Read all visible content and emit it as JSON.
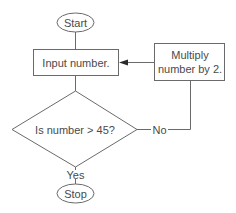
{
  "diagram": {
    "type": "flowchart",
    "nodes": {
      "start": {
        "label": "Start",
        "shape": "ellipse"
      },
      "input": {
        "label": "Input number.",
        "shape": "rectangle"
      },
      "multiply": {
        "line1": "Multiply",
        "line2": "number by 2.",
        "shape": "rectangle"
      },
      "decision": {
        "label": "Is number > 45?",
        "shape": "diamond"
      },
      "stop": {
        "label": "Stop",
        "shape": "ellipse"
      }
    },
    "edges": {
      "start_to_input": {
        "from": "start",
        "to": "input",
        "label": ""
      },
      "input_to_decision": {
        "from": "input",
        "to": "decision",
        "label": ""
      },
      "decision_no": {
        "from": "decision",
        "to": "multiply",
        "label": "No"
      },
      "multiply_to_input": {
        "from": "multiply",
        "to": "input",
        "label": ""
      },
      "decision_yes": {
        "from": "decision",
        "to": "stop",
        "label": "Yes"
      }
    },
    "colors": {
      "stroke": "#6a6a6a",
      "text": "#4a4a4a",
      "background": "#ffffff"
    }
  }
}
